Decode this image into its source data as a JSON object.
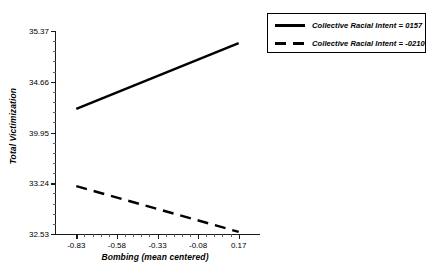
{
  "chart_data": {
    "type": "line",
    "title": "",
    "xlabel": "Bombing (mean centered)",
    "ylabel": "Total Victimization",
    "xlim": [
      -0.955,
      0.295
    ],
    "ylim": [
      32.53,
      35.37
    ],
    "grid": false,
    "legend_position": "top-right",
    "xticks": [
      "-0.83",
      "-0.58",
      "-0.33",
      "-0.08",
      "0.17"
    ],
    "xtick_values": [
      -0.83,
      -0.58,
      -0.33,
      -0.08,
      0.17
    ],
    "yticks": [
      "35.37",
      "34.66",
      "39.95",
      "33.24",
      "32.53"
    ],
    "ytick_values": [
      35.37,
      34.66,
      33.95,
      33.24,
      32.53
    ],
    "x": [
      -0.83,
      0.17
    ],
    "series": [
      {
        "name": "Collective Racial Intent = 0157",
        "style": "solid",
        "color": "#000000",
        "values": [
          34.28,
          35.2
        ]
      },
      {
        "name": "Collective Racial Intent = -0210",
        "style": "dashed",
        "color": "#000000",
        "values": [
          33.2,
          32.56
        ]
      }
    ]
  },
  "legend": {
    "items": [
      {
        "label": "Collective Racial Intent = 0157",
        "style": "solid"
      },
      {
        "label": "Collective Racial Intent = -0210",
        "style": "dashed"
      }
    ]
  }
}
